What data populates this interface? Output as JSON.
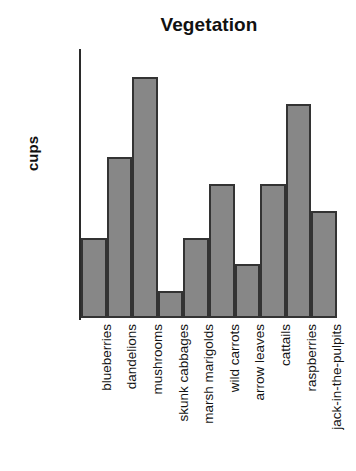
{
  "chart_data": {
    "type": "bar",
    "title": "Vegetation",
    "xlabel": "",
    "ylabel": "cups",
    "categories": [
      "blueberries",
      "dandelions",
      "mushrooms",
      "skunk cabbages",
      "marsh marigolds",
      "wild carrots",
      "arrow leaves",
      "cattails",
      "raspberries",
      "jack-in-the-pulpits"
    ],
    "values": [
      15,
      30,
      45,
      5,
      15,
      25,
      10,
      25,
      40,
      20
    ],
    "ylim": [
      0,
      50
    ],
    "ytick_labels": [
      "0",
      "5",
      "10",
      "15",
      "20",
      "25",
      "30",
      "35",
      "40",
      "45",
      "50"
    ],
    "ytick_values": [
      0,
      5,
      10,
      15,
      20,
      25,
      30,
      35,
      40,
      45,
      50
    ],
    "grid": false,
    "legend": null,
    "bar_fill_color": "#878787",
    "bar_edge_color": "#333333",
    "background_color": "#ffffff",
    "text_color": "#141414"
  }
}
